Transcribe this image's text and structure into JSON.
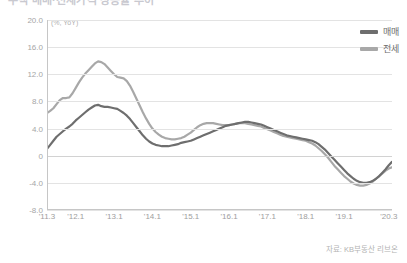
{
  "title_sliver": "주택 매매·전세가격 상승률 추이",
  "unit_label": "(%, YoY)",
  "source_note": "자료: KB부동산 리브온",
  "legend": {
    "position": "top-right",
    "items": [
      {
        "label": "매매",
        "color": "#6e6e6e"
      },
      {
        "label": "전세",
        "color": "#a8a8a8"
      }
    ]
  },
  "chart_data": {
    "type": "line",
    "title": "주택 매매·전세가격 상승률 추이",
    "xlabel": "",
    "ylabel": "(%, YoY)",
    "ylim": [
      -8.0,
      20.0
    ],
    "yticks": [
      20.0,
      16.0,
      12.0,
      8.0,
      4.0,
      0,
      -4.0,
      -8.0
    ],
    "ytick_labels": [
      "20.0",
      "16.0",
      "12.0",
      "8.0",
      "4.0",
      "0",
      "-4.0",
      "-8.0"
    ],
    "grid": true,
    "xticks": [
      "'11.3",
      "'12.1",
      "'13.1",
      "'14.1",
      "'15.1",
      "'16.1",
      "'17.1",
      "'18.1",
      "'19.1",
      "'20.3"
    ],
    "xtick_positions": [
      0,
      9,
      21,
      33,
      45,
      57,
      69,
      81,
      93,
      107
    ],
    "x_index_range": [
      0,
      108
    ],
    "series": [
      {
        "name": "매매",
        "color": "#6e6e6e",
        "values": [
          1.0,
          1.6,
          2.2,
          2.8,
          3.2,
          3.6,
          4.0,
          4.3,
          4.7,
          5.2,
          5.6,
          6.0,
          6.4,
          6.8,
          7.1,
          7.4,
          7.5,
          7.3,
          7.2,
          7.2,
          7.1,
          7.0,
          6.9,
          6.6,
          6.3,
          5.9,
          5.4,
          4.8,
          4.2,
          3.6,
          3.0,
          2.5,
          2.1,
          1.8,
          1.6,
          1.5,
          1.4,
          1.4,
          1.4,
          1.5,
          1.6,
          1.7,
          1.9,
          2.0,
          2.1,
          2.2,
          2.4,
          2.6,
          2.8,
          3.0,
          3.2,
          3.4,
          3.6,
          3.8,
          4.0,
          4.2,
          4.4,
          4.5,
          4.6,
          4.7,
          4.8,
          4.9,
          5.0,
          5.0,
          4.9,
          4.8,
          4.7,
          4.6,
          4.4,
          4.2,
          4.0,
          3.8,
          3.6,
          3.4,
          3.2,
          3.0,
          2.9,
          2.8,
          2.7,
          2.6,
          2.5,
          2.4,
          2.3,
          2.2,
          2.0,
          1.7,
          1.3,
          0.9,
          0.4,
          -0.1,
          -0.6,
          -1.1,
          -1.6,
          -2.1,
          -2.6,
          -3.0,
          -3.4,
          -3.7,
          -3.9,
          -4.0,
          -4.0,
          -3.9,
          -3.7,
          -3.4,
          -3.0,
          -2.5,
          -2.0,
          -1.4,
          -0.9
        ]
      },
      {
        "name": "전세",
        "color": "#a8a8a8",
        "values": [
          6.3,
          6.6,
          7.0,
          7.6,
          8.2,
          8.5,
          8.5,
          8.6,
          9.2,
          10.0,
          10.8,
          11.5,
          12.1,
          12.6,
          13.1,
          13.6,
          13.9,
          13.8,
          13.5,
          13.0,
          12.5,
          12.0,
          11.6,
          11.5,
          11.4,
          11.0,
          10.3,
          9.4,
          8.4,
          7.4,
          6.4,
          5.5,
          4.7,
          4.0,
          3.5,
          3.1,
          2.8,
          2.6,
          2.5,
          2.4,
          2.4,
          2.5,
          2.6,
          2.8,
          3.1,
          3.4,
          3.8,
          4.2,
          4.5,
          4.7,
          4.8,
          4.8,
          4.8,
          4.7,
          4.6,
          4.5,
          4.5,
          4.5,
          4.6,
          4.7,
          4.8,
          4.8,
          4.8,
          4.7,
          4.6,
          4.5,
          4.4,
          4.3,
          4.1,
          3.9,
          3.7,
          3.5,
          3.3,
          3.1,
          2.9,
          2.8,
          2.7,
          2.6,
          2.5,
          2.4,
          2.3,
          2.2,
          2.0,
          1.8,
          1.5,
          1.1,
          0.7,
          0.2,
          -0.3,
          -0.9,
          -1.5,
          -2.0,
          -2.5,
          -3.0,
          -3.4,
          -3.8,
          -4.1,
          -4.3,
          -4.4,
          -4.4,
          -4.3,
          -4.1,
          -3.8,
          -3.4,
          -3.0,
          -2.6,
          -2.2,
          -1.9,
          -1.7
        ]
      }
    ]
  }
}
